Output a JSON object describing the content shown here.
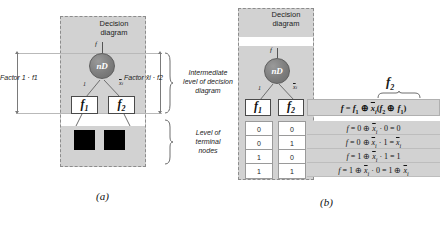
{
  "figure": {
    "caption_a": "(a)",
    "caption_b": "(b)"
  },
  "panel_a": {
    "title": "Decision\ndiagram",
    "node_label": "nD",
    "node_top_edge_label": "f",
    "edge_left_label": "1",
    "edge_right_label": "x̄i",
    "child_left": "f1",
    "child_right": "f2",
    "factor_left": "Factor\n1 · f1",
    "factor_right": "Factor\nx̄i · f2",
    "note_intermediate": "Intermediate\nlevel of decision\ndiagram",
    "note_terminal": "Level of\nterminal\nnodes"
  },
  "panel_b": {
    "title": "Decision\ndiagram",
    "node_label": "nD",
    "node_top_edge_label": "f",
    "edge_left_label": "1",
    "edge_right_label": "x̄i",
    "child_left": "f1",
    "child_right": "f2",
    "brace_label": "f2",
    "table": {
      "headers": [
        "f1",
        "f2",
        "f = f1 ⊕ x̄i(f2 ⊕ f1)"
      ],
      "rows": [
        {
          "f1": "0",
          "f2": "0",
          "equation": "f = 0 ⊕  x̄i · 0 = 0"
        },
        {
          "f1": "0",
          "f2": "1",
          "equation": "f = 0 ⊕  x̄i · 1 =  x̄i"
        },
        {
          "f1": "1",
          "f2": "0",
          "equation": "f = 1 ⊕  x̄i · 1 = 1"
        },
        {
          "f1": "1",
          "f2": "1",
          "equation": "f = 1 ⊕  x̄i · 0 = 1 ⊕  x̄i"
        }
      ]
    }
  },
  "colors": {
    "panel_gray": "#d2d2d2",
    "node_gray": "#7d7d7d",
    "terminal_black": "#000000",
    "border_dash": "#8c8c8c"
  }
}
